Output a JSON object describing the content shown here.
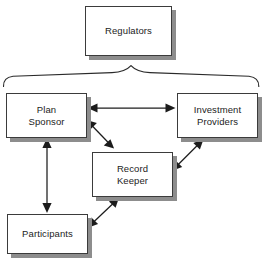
{
  "diagram": {
    "type": "relationship-diagram",
    "background_color": "#ffffff",
    "line_color": "#1c1c1c",
    "box_fill_color": "#ffffff",
    "box_border_color": "#3b3b3b",
    "box_shadow_color": "#8d8d8d",
    "nodes": [
      {
        "id": "regulators",
        "label": "Regulators"
      },
      {
        "id": "plan_sponsor",
        "label": "Plan\nSponsor"
      },
      {
        "id": "investment_providers",
        "label": "Investment\nProviders"
      },
      {
        "id": "record_keeper",
        "label": "Record\nKeeper"
      },
      {
        "id": "participants",
        "label": "Participants"
      }
    ],
    "connectors": [
      {
        "id": "brace",
        "kind": "brace",
        "from": "regulators",
        "spans": [
          "plan_sponsor",
          "investment_providers",
          "record_keeper",
          "participants"
        ]
      },
      {
        "id": "plan-sponsor-to-investment-providers",
        "kind": "double-arrow",
        "from": "plan_sponsor",
        "to": "investment_providers"
      },
      {
        "id": "plan-sponsor-to-record-keeper",
        "kind": "double-arrow",
        "from": "plan_sponsor",
        "to": "record_keeper"
      },
      {
        "id": "investment-providers-to-record-keeper",
        "kind": "double-arrow",
        "from": "investment_providers",
        "to": "record_keeper"
      },
      {
        "id": "plan-sponsor-to-participants",
        "kind": "double-arrow",
        "from": "plan_sponsor",
        "to": "participants"
      },
      {
        "id": "participants-to-record-keeper",
        "kind": "double-arrow",
        "from": "participants",
        "to": "record_keeper"
      }
    ]
  }
}
